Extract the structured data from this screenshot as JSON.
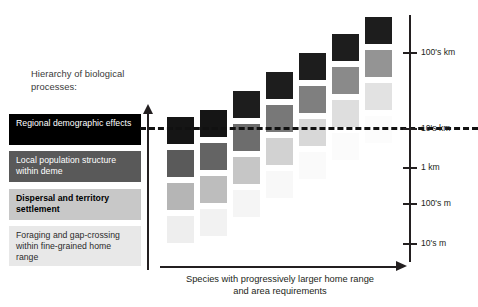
{
  "figure": {
    "hierarchy_title": "Hierarchy of biological processes:",
    "x_axis_caption": "Species with progressively larger home range and area requirements"
  },
  "hierarchy": {
    "title_line_1": "Hierarchy of biological",
    "title_line_2": "processes:",
    "boxes": [
      {
        "label": "Regional demographic effects",
        "bg": "#000000",
        "fg": "#ffffff",
        "bold": false
      },
      {
        "label": "Local population structure within deme",
        "bg": "#595959",
        "fg": "#ffffff",
        "bold": false
      },
      {
        "label": "Dispersal and territory settlement",
        "bg": "#c8c8c8",
        "fg": "#000000",
        "bold": true
      },
      {
        "label": "Foraging and gap-crossing within fine-grained home range",
        "bg": "#e8e8e8",
        "fg": "#2b2b2b",
        "bold": false
      }
    ]
  },
  "scale_axis": {
    "ticks": [
      {
        "label": "100's km",
        "y": 52
      },
      {
        "label": "10's km",
        "y": 128
      },
      {
        "label": "1 km",
        "y": 167
      },
      {
        "label": "100's m",
        "y": 203
      },
      {
        "label": "10's m",
        "y": 243
      }
    ]
  },
  "caption": {
    "line_1": "Species with progressively larger home range",
    "line_2": "and area requirements"
  },
  "chart_data": {
    "type": "heatmap",
    "xlabel": "Species with progressively larger home range and area requirements",
    "ylabel": "Spatial scale",
    "grid": false,
    "legend": "none",
    "threshold_line": {
      "style": "dashed",
      "value_label": "10's km",
      "y": 127
    },
    "ylim_labels": [
      "10's m",
      "100's m",
      "1 km",
      "10's km",
      "100's km"
    ],
    "row_levels": [
      "Regional demographic effects",
      "Local population structure within deme",
      "Dispersal and territory settlement",
      "Foraging and gap-crossing within fine-grained home range"
    ],
    "columns": [
      {
        "index": 1,
        "x": 167,
        "top": 117,
        "cells": [
          {
            "level": "Regional demographic effects",
            "shade": "#151515",
            "y": 117
          },
          {
            "level": "Local population structure within deme",
            "shade": "#5a5a5a",
            "y": 150
          },
          {
            "level": "Dispersal and territory settlement",
            "shade": "#b5b5b5",
            "y": 183
          },
          {
            "level": "Foraging and gap-crossing within fine-grained home range",
            "shade": "#eeeeee",
            "y": 216
          }
        ]
      },
      {
        "index": 2,
        "x": 200,
        "top": 110,
        "cells": [
          {
            "level": "Regional demographic effects",
            "shade": "#151515",
            "y": 110
          },
          {
            "level": "Local population structure within deme",
            "shade": "#646464",
            "y": 143
          },
          {
            "level": "Dispersal and territory settlement",
            "shade": "#bdbdbd",
            "y": 176
          },
          {
            "level": "Foraging and gap-crossing within fine-grained home range",
            "shade": "#f2f2f2",
            "y": 209
          }
        ]
      },
      {
        "index": 3,
        "x": 233,
        "top": 91,
        "cells": [
          {
            "level": "Regional demographic effects",
            "shade": "#1d1d1d",
            "y": 91
          },
          {
            "level": "Local population structure within deme",
            "shade": "#6d6d6d",
            "y": 124
          },
          {
            "level": "Dispersal and territory settlement",
            "shade": "#c6c6c6",
            "y": 157
          },
          {
            "level": "Foraging and gap-crossing within fine-grained home range",
            "shade": "#f5f5f5",
            "y": 190
          }
        ]
      },
      {
        "index": 4,
        "x": 266,
        "top": 72,
        "cells": [
          {
            "level": "Regional demographic effects",
            "shade": "#1d1d1d",
            "y": 72
          },
          {
            "level": "Local population structure within deme",
            "shade": "#787878",
            "y": 105
          },
          {
            "level": "Dispersal and territory settlement",
            "shade": "#d2d2d2",
            "y": 138
          },
          {
            "level": "Foraging and gap-crossing within fine-grained home range",
            "shade": "#f8f8f8",
            "y": 171
          }
        ]
      },
      {
        "index": 5,
        "x": 299,
        "top": 53,
        "cells": [
          {
            "level": "Regional demographic effects",
            "shade": "#1d1d1d",
            "y": 53
          },
          {
            "level": "Local population structure within deme",
            "shade": "#7f7f7f",
            "y": 86
          },
          {
            "level": "Dispersal and territory settlement",
            "shade": "#d8d8d8",
            "y": 119
          },
          {
            "level": "Foraging and gap-crossing within fine-grained home range",
            "shade": "#fafafa",
            "y": 152
          }
        ]
      },
      {
        "index": 6,
        "x": 332,
        "top": 34,
        "cells": [
          {
            "level": "Regional demographic effects",
            "shade": "#1d1d1d",
            "y": 34
          },
          {
            "level": "Local population structure within deme",
            "shade": "#8a8a8a",
            "y": 67
          },
          {
            "level": "Dispersal and territory settlement",
            "shade": "#dedede",
            "y": 100
          },
          {
            "level": "Foraging and gap-crossing within fine-grained home range",
            "shade": "#fbfbfb",
            "y": 133
          }
        ]
      },
      {
        "index": 7,
        "x": 365,
        "top": 17,
        "cells": [
          {
            "level": "Regional demographic effects",
            "shade": "#1d1d1d",
            "y": 17
          },
          {
            "level": "Local population structure within deme",
            "shade": "#949494",
            "y": 50
          },
          {
            "level": "Dispersal and territory settlement",
            "shade": "#e2e2e2",
            "y": 83
          },
          {
            "level": "Foraging and gap-crossing within fine-grained home range",
            "shade": "#fcfcfc",
            "y": 116
          }
        ]
      }
    ]
  }
}
